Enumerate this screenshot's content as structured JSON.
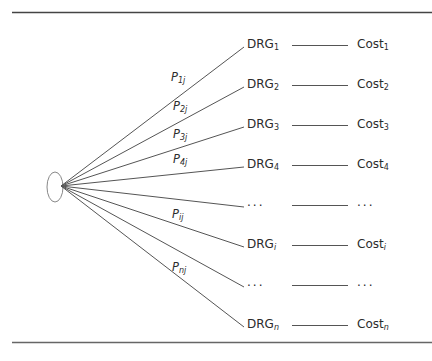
{
  "diagram": {
    "rows": [
      {
        "drg": "DRG",
        "drg_sub": "1",
        "cost": "Cost",
        "cost_sub": "1",
        "prob": "P",
        "prob_sub": "1j",
        "y": 45
      },
      {
        "drg": "DRG",
        "drg_sub": "2",
        "cost": "Cost",
        "cost_sub": "2",
        "prob": "P",
        "prob_sub": "2j",
        "y": 85
      },
      {
        "drg": "DRG",
        "drg_sub": "3",
        "cost": "Cost",
        "cost_sub": "3",
        "prob": "P",
        "prob_sub": "3j",
        "y": 125
      },
      {
        "drg": "DRG",
        "drg_sub": "4",
        "cost": "Cost",
        "cost_sub": "4",
        "prob": "P",
        "prob_sub": "4j",
        "y": 165
      },
      {
        "drg": "...",
        "drg_sub": "",
        "cost": "...",
        "cost_sub": "",
        "prob": "",
        "prob_sub": "",
        "y": 205
      },
      {
        "drg": "DRG",
        "drg_sub": "i",
        "cost": "Cost",
        "cost_sub": "i",
        "prob": "P",
        "prob_sub": "ij",
        "y": 245
      },
      {
        "drg": "...",
        "drg_sub": "",
        "cost": "...",
        "cost_sub": "",
        "prob": "",
        "prob_sub": "",
        "y": 285
      },
      {
        "drg": "DRG",
        "drg_sub": "n",
        "cost": "Cost",
        "cost_sub": "n",
        "prob": "P",
        "prob_sub": "nj",
        "y": 325
      }
    ],
    "prob_labels": [
      {
        "text": "P",
        "sub": "1j",
        "x": 171,
        "y": 70
      },
      {
        "text": "P",
        "sub": "2j",
        "x": 173,
        "y": 99
      },
      {
        "text": "P",
        "sub": "3j",
        "x": 173,
        "y": 127
      },
      {
        "text": "P",
        "sub": "4j",
        "x": 173,
        "y": 152
      },
      {
        "text": "P",
        "sub": "ij",
        "x": 172,
        "y": 207
      },
      {
        "text": "P",
        "sub": "nj",
        "x": 172,
        "y": 260
      }
    ],
    "origin_node": "ellipse",
    "line_color": "#555555"
  }
}
